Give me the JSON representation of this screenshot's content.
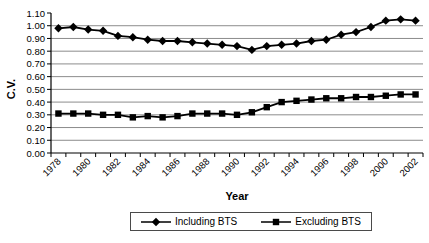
{
  "chart_data": {
    "type": "line",
    "title": "",
    "xlabel": "Year",
    "ylabel": "C.V.",
    "ylim": [
      0,
      1.1
    ],
    "ytick_step": 0.1,
    "ytick_labels": [
      "1.10",
      "1.00",
      "0.90",
      "0.80",
      "0.70",
      "0.60",
      "0.50",
      "0.40",
      "0.30",
      "0.20",
      "0.10",
      "0.00"
    ],
    "grid": true,
    "legend_position": "bottom",
    "x": [
      1978,
      1979,
      1980,
      1981,
      1982,
      1983,
      1984,
      1985,
      1986,
      1987,
      1988,
      1989,
      1990,
      1991,
      1992,
      1993,
      1994,
      1995,
      1996,
      1997,
      1998,
      1999,
      2000,
      2001,
      2002
    ],
    "xtick_labels": [
      "1978",
      "1980",
      "1982",
      "1984",
      "1986",
      "1988",
      "1990",
      "1992",
      "1994",
      "1996",
      "1998",
      "2000",
      "2002"
    ],
    "series": [
      {
        "name": "Including BTS",
        "marker": "diamond",
        "color": "#000000",
        "values": [
          0.98,
          0.99,
          0.97,
          0.96,
          0.92,
          0.91,
          0.89,
          0.88,
          0.88,
          0.87,
          0.86,
          0.85,
          0.84,
          0.81,
          0.84,
          0.85,
          0.86,
          0.88,
          0.89,
          0.93,
          0.95,
          0.99,
          1.04,
          1.05,
          1.04
        ]
      },
      {
        "name": "Excluding BTS",
        "marker": "square",
        "color": "#000000",
        "values": [
          0.31,
          0.31,
          0.31,
          0.3,
          0.3,
          0.28,
          0.29,
          0.28,
          0.29,
          0.31,
          0.31,
          0.31,
          0.3,
          0.32,
          0.36,
          0.4,
          0.41,
          0.42,
          0.43,
          0.43,
          0.44,
          0.44,
          0.45,
          0.46,
          0.46
        ]
      }
    ],
    "gridline_color": "#8c8c8c",
    "axis_color": "#000000"
  }
}
